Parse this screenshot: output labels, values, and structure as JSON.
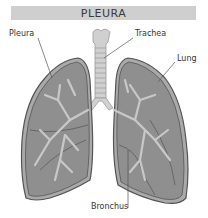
{
  "title": "PLEURA",
  "labels": {
    "pleura": "Pleura",
    "trachea": "Trachea",
    "lung": "Lung",
    "bronchus": "Bronchus"
  },
  "colors": {
    "title_bg": "#cfcfcf",
    "lung_fill": "#8f8f8f",
    "lung_outline": "#555555",
    "pleura_layer": "#a9a9a9",
    "airway": "#c8c8c8",
    "trachea": "#d0d0d0"
  }
}
